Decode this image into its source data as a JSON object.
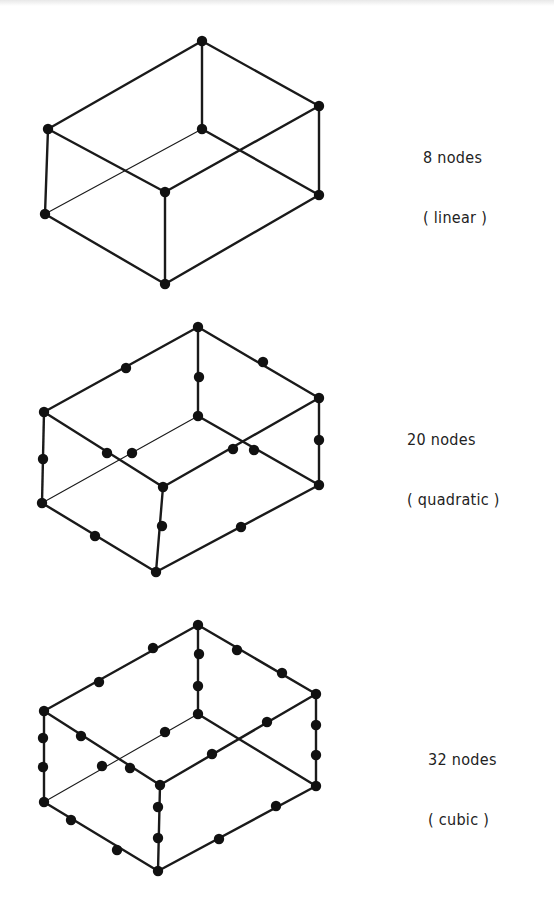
{
  "figure": {
    "elements": [
      {
        "id": "linear",
        "count_label": "8 nodes",
        "type_label": "( linear )",
        "label_pos": [
          423,
          108
        ],
        "corners": {
          "top": [
            202,
            41
          ],
          "rt": [
            319,
            106
          ],
          "lt": [
            48,
            129
          ],
          "c": [
            202,
            129
          ],
          "ft": [
            165,
            192
          ],
          "rb": [
            319,
            195
          ],
          "lb": [
            45,
            214
          ],
          "b": [
            165,
            284
          ]
        },
        "mid_nodes": []
      },
      {
        "id": "quadratic",
        "count_label": "20 nodes",
        "type_label": "( quadratic )",
        "label_pos": [
          407,
          390
        ],
        "corners": {
          "top": [
            198,
            327
          ],
          "rt": [
            319,
            398
          ],
          "lt": [
            44,
            412
          ],
          "c": [
            198,
            416
          ],
          "ft": [
            163,
            487
          ],
          "rb": [
            319,
            485
          ],
          "lb": [
            42,
            503
          ],
          "b": [
            156,
            572
          ]
        },
        "mid_nodes": [
          [
            126,
            368
          ],
          [
            199,
            377
          ],
          [
            263,
            362
          ],
          [
            43,
            459
          ],
          [
            319,
            440
          ],
          [
            107,
            453
          ],
          [
            132,
            453
          ],
          [
            233,
            449
          ],
          [
            254,
            450
          ],
          [
            162,
            526
          ],
          [
            95,
            536
          ],
          [
            241,
            527
          ]
        ]
      },
      {
        "id": "cubic",
        "count_label": "32 nodes",
        "type_label": "( cubic )",
        "label_pos": [
          428,
          710
        ],
        "corners": {
          "top": [
            198,
            625
          ],
          "rt": [
            316,
            694
          ],
          "lt": [
            44,
            711
          ],
          "c": [
            198,
            714
          ],
          "ft": [
            160,
            785
          ],
          "rb": [
            316,
            786
          ],
          "lb": [
            44,
            802
          ],
          "b": [
            158,
            871
          ]
        },
        "mid_nodes": [
          [
            153,
            648
          ],
          [
            99,
            682
          ],
          [
            199,
            654
          ],
          [
            198,
            686
          ],
          [
            237,
            650
          ],
          [
            282,
            673
          ],
          [
            43,
            738
          ],
          [
            43,
            767
          ],
          [
            316,
            725
          ],
          [
            316,
            755
          ],
          [
            81,
            736
          ],
          [
            130,
            768
          ],
          [
            165,
            732
          ],
          [
            102,
            766
          ],
          [
            267,
            722
          ],
          [
            212,
            754
          ],
          [
            158,
            807
          ],
          [
            158,
            838
          ],
          [
            71,
            820
          ],
          [
            117,
            850
          ],
          [
            276,
            806
          ],
          [
            219,
            839
          ]
        ]
      }
    ]
  }
}
